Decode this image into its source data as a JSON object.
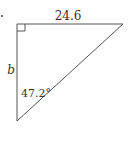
{
  "diagram": {
    "type": "right-triangle",
    "top_side_label": "24.6",
    "left_side_label": "b",
    "angle_label": "47.2°",
    "right_angle_marker": true,
    "colors": {
      "stroke": "#555555",
      "text": "#333333",
      "background": "#ffffff"
    }
  }
}
